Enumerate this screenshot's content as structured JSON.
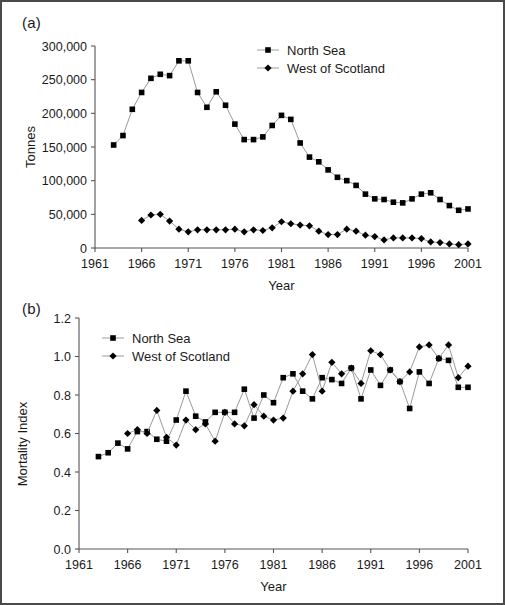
{
  "figure": {
    "background": "#ffffff",
    "border_color": "#4a4a4a",
    "line_color": "#9a9a9a",
    "marker_color": "#000000",
    "axis_color": "#555555"
  },
  "panels": {
    "a": {
      "label": "(a)"
    },
    "b": {
      "label": "(b)"
    }
  },
  "legend": {
    "north_sea": "North Sea",
    "west_of_scotland": "West of Scotland"
  },
  "chart_data": [
    {
      "type": "line",
      "panel": "(a)",
      "title": "",
      "xlabel": "Year",
      "ylabel": "Tonnes",
      "xlim": [
        1961,
        2001
      ],
      "ylim": [
        0,
        300000
      ],
      "xticks": [
        1961,
        1966,
        1971,
        1976,
        1981,
        1986,
        1991,
        1996,
        2001
      ],
      "xticklabels": [
        "1961",
        "1966",
        "1971",
        "1976",
        "1981",
        "1986",
        "1991",
        "1996",
        "2001"
      ],
      "yticks": [
        0,
        50000,
        100000,
        150000,
        200000,
        250000,
        300000
      ],
      "yticklabels": [
        "0",
        "50,000",
        "100,000",
        "150,000",
        "200,000",
        "250,000",
        "300,000"
      ],
      "grid": false,
      "legend_position": "top-right-inside",
      "x": [
        1963,
        1964,
        1965,
        1966,
        1967,
        1968,
        1969,
        1970,
        1971,
        1972,
        1973,
        1974,
        1975,
        1976,
        1977,
        1978,
        1979,
        1980,
        1981,
        1982,
        1983,
        1984,
        1985,
        1986,
        1987,
        1988,
        1989,
        1990,
        1991,
        1992,
        1993,
        1994,
        1995,
        1996,
        1997,
        1998,
        1999,
        2000,
        2001
      ],
      "series": [
        {
          "name": "North Sea",
          "marker": "square",
          "values": [
            153000,
            167000,
            206000,
            231000,
            252000,
            258000,
            256000,
            278000,
            278000,
            231000,
            209000,
            232000,
            212000,
            184000,
            161000,
            161000,
            165000,
            182000,
            197000,
            191000,
            156000,
            135000,
            128000,
            116000,
            105000,
            100000,
            93000,
            80000,
            73000,
            72000,
            68000,
            67000,
            73000,
            80000,
            82000,
            72000,
            63000,
            56000,
            58000
          ]
        },
        {
          "name": "West of Scotland",
          "marker": "diamond",
          "values": [
            null,
            null,
            null,
            41000,
            49000,
            50000,
            40000,
            28000,
            24000,
            27000,
            27000,
            27000,
            27000,
            28000,
            24000,
            27000,
            26000,
            30000,
            39000,
            36000,
            34000,
            33000,
            25000,
            20000,
            20000,
            28000,
            25000,
            19000,
            17000,
            12000,
            15000,
            15000,
            15000,
            14000,
            9000,
            8000,
            6000,
            5000,
            6000
          ]
        }
      ]
    },
    {
      "type": "line",
      "panel": "(b)",
      "title": "",
      "xlabel": "Year",
      "ylabel": "Mortality Index",
      "xlim": [
        1961,
        2001
      ],
      "ylim": [
        0.0,
        1.2
      ],
      "xticks": [
        1961,
        1966,
        1971,
        1976,
        1981,
        1986,
        1991,
        1996,
        2001
      ],
      "xticklabels": [
        "1961",
        "1966",
        "1971",
        "1976",
        "1981",
        "1986",
        "1991",
        "1996",
        "2001"
      ],
      "yticks": [
        0.0,
        0.2,
        0.4,
        0.6,
        0.8,
        1.0,
        1.2
      ],
      "yticklabels": [
        "0.0",
        "0.2",
        "0.4",
        "0.6",
        "0.8",
        "1.0",
        "1.2"
      ],
      "grid": false,
      "legend_position": "top-left-inside",
      "x": [
        1963,
        1964,
        1965,
        1966,
        1967,
        1968,
        1969,
        1970,
        1971,
        1972,
        1973,
        1974,
        1975,
        1976,
        1977,
        1978,
        1979,
        1980,
        1981,
        1982,
        1983,
        1984,
        1985,
        1986,
        1987,
        1988,
        1989,
        1990,
        1991,
        1992,
        1993,
        1994,
        1995,
        1996,
        1997,
        1998,
        1999,
        2000,
        2001
      ],
      "series": [
        {
          "name": "North Sea",
          "marker": "square",
          "values": [
            0.48,
            0.5,
            0.55,
            0.52,
            0.61,
            0.61,
            0.57,
            0.56,
            0.67,
            0.82,
            0.69,
            0.66,
            0.71,
            0.71,
            0.71,
            0.83,
            0.68,
            0.8,
            0.76,
            0.89,
            0.91,
            0.82,
            0.78,
            0.89,
            0.88,
            0.86,
            0.94,
            0.78,
            0.93,
            0.85,
            0.93,
            0.87,
            0.73,
            0.92,
            0.86,
            0.99,
            0.98,
            0.84,
            0.84
          ]
        },
        {
          "name": "West of Scotland",
          "marker": "diamond",
          "values": [
            null,
            null,
            null,
            0.6,
            0.62,
            0.6,
            0.72,
            0.58,
            0.54,
            0.67,
            0.62,
            0.65,
            0.56,
            0.71,
            0.65,
            0.64,
            0.75,
            0.69,
            0.67,
            0.68,
            0.82,
            0.91,
            1.01,
            0.82,
            0.97,
            0.91,
            0.94,
            0.86,
            1.03,
            1.01,
            0.93,
            0.87,
            0.92,
            1.05,
            1.06,
            0.99,
            1.06,
            0.89,
            0.95
          ]
        }
      ]
    }
  ]
}
